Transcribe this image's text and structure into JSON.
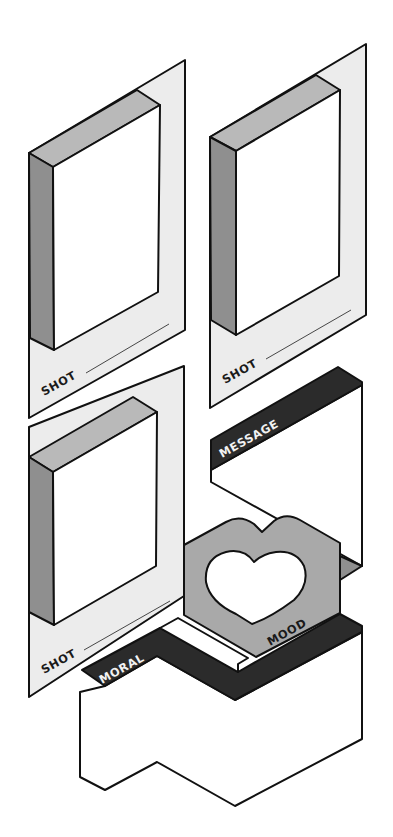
{
  "illustration": {
    "title": "Isometric storyboard concept",
    "colors": {
      "background": "#ffffff",
      "frame_paper": "#ececec",
      "screen": "#ffffff",
      "bevel_top": "#b9b9b9",
      "bevel_side": "#8f8f8f",
      "band_dark": "#2b2b2b",
      "heart_block": "#a9a9a9",
      "outline": "#111111"
    },
    "frames": [
      {
        "id": "frame-top-left",
        "label": "SHOT"
      },
      {
        "id": "frame-top-right",
        "label": "SHOT"
      },
      {
        "id": "frame-bottom-left",
        "label": "SHOT"
      }
    ],
    "bands": {
      "message": "MESSAGE",
      "moral": "MORAL",
      "mood": "MOOD"
    },
    "icons": {
      "heart": "heart-icon"
    }
  }
}
